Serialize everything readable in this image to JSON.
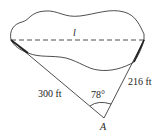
{
  "diagram": {
    "type": "geometry-word-problem",
    "labels": {
      "length": "l",
      "left_side": "300 ft",
      "right_side": "216 ft",
      "angle": "78°",
      "vertex": "A"
    },
    "colors": {
      "stroke": "#222222",
      "background": "#ffffff"
    }
  }
}
